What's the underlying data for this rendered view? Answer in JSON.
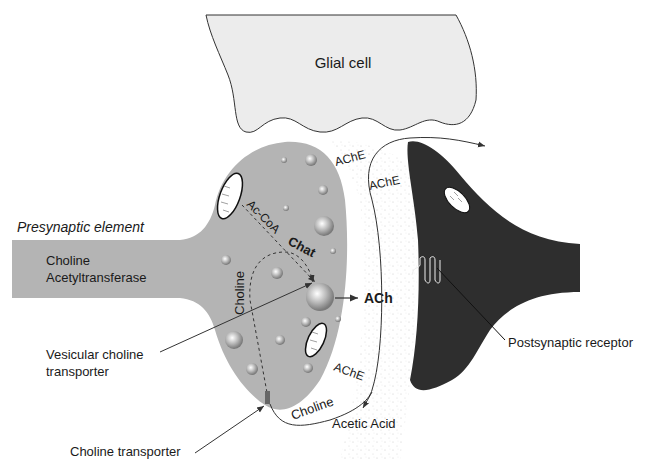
{
  "colors": {
    "presynaptic_fill": "#b4b4b4",
    "glial_fill": "#ececec",
    "postsynaptic_fill": "#2e2e2e",
    "cleft_stipple": "#d0d0d0",
    "line": "#333333"
  },
  "labels": {
    "glial_cell": "Glial cell",
    "presynaptic_element": "Presynaptic element",
    "choline_acetyltransferase_line1": "Choline",
    "choline_acetyltransferase_line2": "Acetyltransferase",
    "ac_coa": "Ac-CoA",
    "chat": "Chat",
    "choline_inside": "Choline",
    "ach": "ACh",
    "ache_top": "AChE",
    "ache_right": "AChE",
    "ache_bottom": "AChE",
    "choline_reuptake": "Choline",
    "acetic_acid": "Acetic Acid",
    "vesicular_choline_transporter_line1": "Vesicular choline",
    "vesicular_choline_transporter_line2": "transporter",
    "choline_transporter": "Choline transporter",
    "postsynaptic_receptor": "Postsynaptic receptor"
  }
}
